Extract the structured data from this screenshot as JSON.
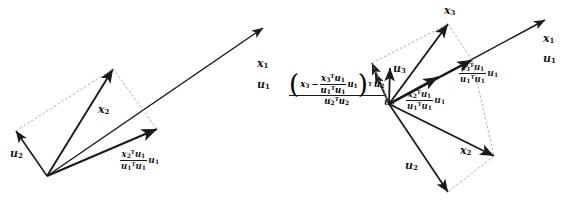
{
  "figure": {
    "panels": [
      {
        "id": "left-panel",
        "name": "two-vector-projection",
        "labels": {
          "x2": "x",
          "x2_sub": "2",
          "u2": "u",
          "u2_sub": "2",
          "x1": "x",
          "x1_sub": "1",
          "u1": "u",
          "u1_sub": "1"
        },
        "projection_formula": {
          "numerator_vec": "x",
          "numerator_vec_sub": "2",
          "numerator_T": "T",
          "numerator_u": "u",
          "numerator_u_sub": "1",
          "denominator_u": "u",
          "denominator_u_sub": "1",
          "denominator_T": "T",
          "denominator_u2": "u",
          "denominator_u2_sub": "1",
          "tail": "u",
          "tail_sub": "1"
        }
      },
      {
        "id": "right-panel",
        "name": "three-vector-orthogonalization",
        "labels": {
          "x3": "x",
          "x3_sub": "3",
          "u3": "u",
          "u3_sub": "3",
          "u2": "u",
          "u2_sub": "2",
          "x2": "x",
          "x2_sub": "2",
          "x1": "x",
          "x1_sub": "1",
          "u1": "u",
          "u1_sub": "1"
        },
        "proj_x3_on_u1": {
          "num_x": "x",
          "num_x_sub": "3",
          "num_T": "T",
          "num_u": "u",
          "num_u_sub": "1",
          "den_u": "u",
          "den_u_sub": "1",
          "den_T": "T",
          "den_u2": "u",
          "den_u2_sub": "1",
          "tail": "u",
          "tail_sub": "1"
        },
        "proj_x2_on_u1": {
          "num_x": "x",
          "num_x_sub": "2",
          "num_T": "T",
          "num_u": "u",
          "num_u_sub": "1",
          "den_u": "u",
          "den_u_sub": "1",
          "den_T": "T",
          "den_u2": "u",
          "den_u2_sub": "1",
          "tail": "u",
          "tail_sub": "1"
        },
        "big_formula": {
          "open_paren": "(",
          "close_paren": ")",
          "outer_T": "T",
          "lead_x": "x",
          "lead_x_sub": "3",
          "minus": "−",
          "inner_num_x": "x",
          "inner_num_x_sub": "3",
          "inner_num_T": "T",
          "inner_num_u": "u",
          "inner_num_u_sub": "1",
          "inner_den_u": "u",
          "inner_den_u_sub": "1",
          "inner_den_T": "T",
          "inner_den_u2": "u",
          "inner_den_u2_sub": "1",
          "inner_tail_u": "u",
          "inner_tail_u_sub": "1",
          "after_paren_u": "u",
          "after_paren_u_sub": "2",
          "den_u": "u",
          "den_u_sub": "2",
          "den_T": "T",
          "den_u2": "u",
          "den_u2_sub": "2",
          "tail": "u",
          "tail_sub": "2"
        }
      }
    ]
  },
  "style": {
    "stroke": "#1a1a1a",
    "dashed": "#9a9a9a",
    "background": "#ffffff"
  }
}
